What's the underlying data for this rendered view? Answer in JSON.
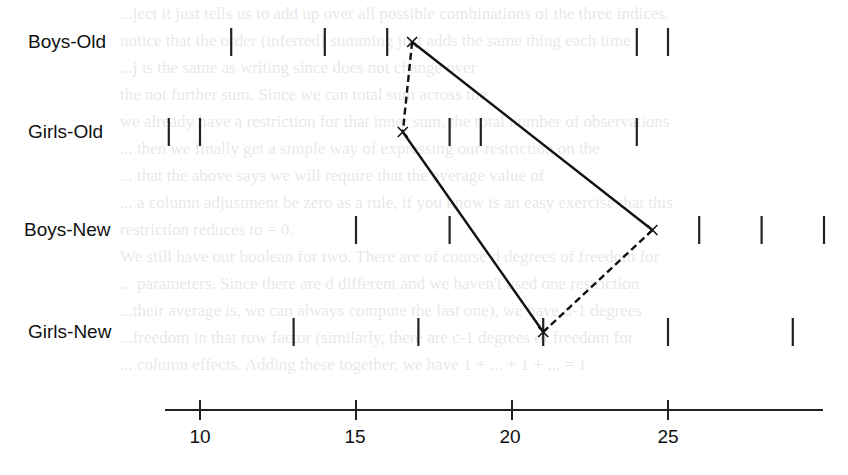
{
  "chart_data": {
    "type": "scatter",
    "title": "",
    "xlabel": "",
    "ylabel": "",
    "x_ticks": [
      10,
      15,
      20,
      25
    ],
    "xlim": [
      6.5,
      31.5
    ],
    "grid": false,
    "legend": null,
    "rows": [
      {
        "label": "Boys-Old",
        "y_px": 42,
        "values": [
          11,
          14,
          16,
          24,
          25
        ]
      },
      {
        "label": "Girls-Old",
        "y_px": 132,
        "values": [
          9,
          10,
          18,
          19,
          24
        ]
      },
      {
        "label": "Boys-New",
        "y_px": 230,
        "values": [
          15,
          18,
          26,
          28,
          30
        ]
      },
      {
        "label": "Girls-New",
        "y_px": 332,
        "values": [
          13,
          17,
          21,
          25,
          29
        ]
      }
    ],
    "diamond": {
      "description": "Means of each group connected; dashed lines join Boys-Old to Girls-Old and Boys-New to Girls-New; solid lines join Boys-Old to Boys-New and Girls-Old to Girls-New",
      "points": {
        "Boys-Old": 16.8,
        "Girls-Old": 16.5,
        "Boys-New": 24.5,
        "Girls-New": 21.0
      },
      "solid_edges": [
        [
          "Boys-Old",
          "Boys-New"
        ],
        [
          "Girls-Old",
          "Girls-New"
        ]
      ],
      "dashed_edges": [
        [
          "Boys-Old",
          "Girls-Old"
        ],
        [
          "Boys-New",
          "Girls-New"
        ]
      ]
    }
  },
  "labels": {
    "row_0": "Boys-Old",
    "row_1": "Girls-Old",
    "row_2": "Boys-New",
    "row_3": "Girls-New",
    "tick_0": "10",
    "tick_1": "15",
    "tick_2": "20",
    "tick_3": "25"
  },
  "background_text": [
    "...ject it just tells us to add up over all possible combinations of the three indices.",
    "notice that the order (inferred) summing just adds the same thing each time",
    "...j is the same as writing   since  does not change over",
    "the not further sum. Since we can  total sum  across the",
    "we already have a restriction for that inner sum, the total number of observations",
    "... then we finally get a simple way of expressing our restriction on the",
    "...  that the above says we will require that the average value of",
    "... a column adjustment be zero as a rule, if you know is an easy exercise that this",
    "restriction reduces to  = 0.",
    "We still have our boolean for two. There are of course d degrees of freedom for",
    "... parameters. Since there are d different and we haven't used one restriction",
    "...their average is, we can always compute the last one), we have d-1 degrees",
    "...freedom in that row factor (similarly, there are c-1 degrees of freedom for",
    "... column effects. Adding these together, we have 1 + ... + 1 + ... = 1"
  ]
}
